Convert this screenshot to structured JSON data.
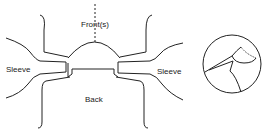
{
  "diagram": {
    "labels": {
      "front": "Front(s)",
      "sleeve_left": "Sleeve",
      "sleeve_right": "Sleeve",
      "back": "Back"
    },
    "colors": {
      "line": "#222222",
      "background": "#ffffff"
    }
  }
}
